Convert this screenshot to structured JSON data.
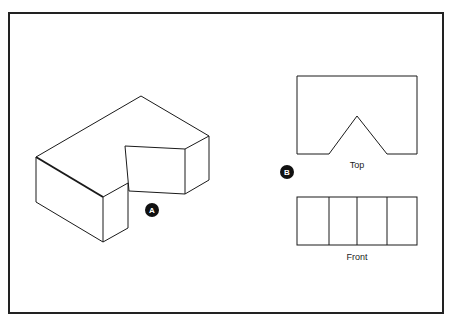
{
  "figure": {
    "frame": {
      "x": 9,
      "y": 13,
      "width": 434,
      "height": 300,
      "stroke": "#222222"
    },
    "isometric_view": {
      "badge": {
        "label": "A",
        "cx": 152,
        "cy": 210
      }
    },
    "orthographic_views": {
      "badge": {
        "label": "B",
        "cx": 287,
        "cy": 172
      },
      "top_view": {
        "label": "Top"
      },
      "front_view": {
        "label": "Front",
        "panel_count": 4
      }
    },
    "colors": {
      "line": "#1a1a1a",
      "badge_fill": "#111111",
      "badge_text": "#ffffff",
      "background": "#ffffff"
    }
  }
}
